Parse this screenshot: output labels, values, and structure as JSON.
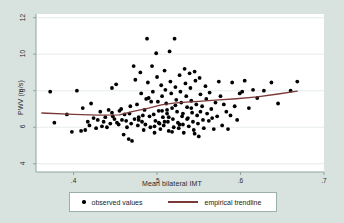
{
  "figure": {
    "background_color": "#d8e2de",
    "plot_background_color": "#ffffff"
  },
  "chart_data": {
    "type": "scatter",
    "title": "",
    "xlabel": "Mean bilateral IMT",
    "ylabel": "PWV (m/s)",
    "xlim": [
      0.355,
      0.7
    ],
    "ylim": [
      3.55,
      12.2
    ],
    "xticks": [
      ".4",
      ".5",
      ".6",
      ".7"
    ],
    "xtick_values": [
      0.4,
      0.5,
      0.6,
      0.7
    ],
    "yticks": [
      "4",
      "6",
      "8",
      "10",
      "12"
    ],
    "ytick_values": [
      4,
      6,
      8,
      10,
      12
    ],
    "grid": "horizontal",
    "legend_position": "bottom",
    "marker_color": "#000000",
    "trendline_color": "#7b3a3a",
    "series": [
      {
        "name": "observed values",
        "type": "scatter",
        "x": [
          0.372,
          0.377,
          0.392,
          0.398,
          0.404,
          0.409,
          0.411,
          0.414,
          0.417,
          0.419,
          0.421,
          0.424,
          0.427,
          0.429,
          0.432,
          0.434,
          0.436,
          0.438,
          0.44,
          0.442,
          0.444,
          0.446,
          0.447,
          0.449,
          0.451,
          0.452,
          0.454,
          0.455,
          0.457,
          0.458,
          0.46,
          0.461,
          0.463,
          0.464,
          0.466,
          0.467,
          0.469,
          0.47,
          0.472,
          0.473,
          0.474,
          0.476,
          0.477,
          0.478,
          0.48,
          0.481,
          0.482,
          0.484,
          0.485,
          0.486,
          0.488,
          0.489,
          0.49,
          0.491,
          0.492,
          0.494,
          0.495,
          0.496,
          0.497,
          0.498,
          0.499,
          0.5,
          0.501,
          0.502,
          0.503,
          0.504,
          0.505,
          0.506,
          0.507,
          0.508,
          0.509,
          0.51,
          0.511,
          0.512,
          0.513,
          0.514,
          0.515,
          0.516,
          0.517,
          0.518,
          0.519,
          0.52,
          0.521,
          0.522,
          0.523,
          0.524,
          0.525,
          0.526,
          0.527,
          0.528,
          0.529,
          0.53,
          0.531,
          0.532,
          0.533,
          0.534,
          0.535,
          0.536,
          0.537,
          0.538,
          0.539,
          0.54,
          0.541,
          0.542,
          0.543,
          0.544,
          0.545,
          0.546,
          0.547,
          0.548,
          0.549,
          0.55,
          0.551,
          0.552,
          0.554,
          0.555,
          0.556,
          0.558,
          0.559,
          0.56,
          0.562,
          0.563,
          0.565,
          0.566,
          0.568,
          0.57,
          0.572,
          0.574,
          0.576,
          0.578,
          0.58,
          0.583,
          0.585,
          0.588,
          0.59,
          0.593,
          0.596,
          0.599,
          0.602,
          0.605,
          0.61,
          0.615,
          0.62,
          0.628,
          0.637,
          0.645,
          0.66,
          0.668,
          0.446,
          0.468,
          0.483,
          0.493,
          0.506,
          0.514,
          0.522,
          0.531,
          0.541,
          0.552,
          0.478,
          0.497,
          0.509,
          0.518,
          0.527,
          0.536,
          0.545,
          0.487,
          0.502,
          0.512
        ],
        "y": [
          7.95,
          6.25,
          6.7,
          5.75,
          8.0,
          5.8,
          7.05,
          5.85,
          6.3,
          6.1,
          7.3,
          6.5,
          5.95,
          6.4,
          6.85,
          6.05,
          6.3,
          6.55,
          6.0,
          6.95,
          6.2,
          8.15,
          6.6,
          6.45,
          8.35,
          6.25,
          6.15,
          6.9,
          7.0,
          6.4,
          5.6,
          6.7,
          6.35,
          6.0,
          5.35,
          6.75,
          6.2,
          5.25,
          9.35,
          6.45,
          8.6,
          7.25,
          6.1,
          6.55,
          9.0,
          7.85,
          6.3,
          5.85,
          6.95,
          6.15,
          10.85,
          8.45,
          7.6,
          6.6,
          6.0,
          9.35,
          7.95,
          6.7,
          5.7,
          6.35,
          10.05,
          8.75,
          7.4,
          6.9,
          6.2,
          5.9,
          8.3,
          7.7,
          6.55,
          6.1,
          9.1,
          8.05,
          7.3,
          6.75,
          6.3,
          5.8,
          10.15,
          8.5,
          7.85,
          7.05,
          6.45,
          6.0,
          10.85,
          8.2,
          7.5,
          6.85,
          6.25,
          5.95,
          8.85,
          7.95,
          7.35,
          6.6,
          6.15,
          5.7,
          9.2,
          8.4,
          7.7,
          7.1,
          6.5,
          6.05,
          8.95,
          8.15,
          7.45,
          6.8,
          6.3,
          5.85,
          9.05,
          8.55,
          7.25,
          6.65,
          6.2,
          5.5,
          8.7,
          7.8,
          7.15,
          6.4,
          5.95,
          8.25,
          7.55,
          6.75,
          6.35,
          7.9,
          7.0,
          6.5,
          5.9,
          7.35,
          6.6,
          8.5,
          7.7,
          6.1,
          7.25,
          6.85,
          5.9,
          6.65,
          8.45,
          7.15,
          6.4,
          7.85,
          7.95,
          8.55,
          7.05,
          8.05,
          7.6,
          8.0,
          8.45,
          7.3,
          8.0,
          8.5,
          6.8,
          7.15,
          6.65,
          7.4,
          6.9,
          6.55,
          7.2,
          6.75,
          7.05,
          6.85,
          6.4,
          6.05,
          6.3,
          5.75,
          6.15,
          6.45,
          5.65,
          7.55,
          6.25,
          6.95
        ],
        "count": 168
      },
      {
        "name": "empirical trendline",
        "type": "line",
        "x": [
          0.362,
          0.4,
          0.43,
          0.455,
          0.47,
          0.49,
          0.505,
          0.52,
          0.535,
          0.55,
          0.57,
          0.595,
          0.62,
          0.645,
          0.668
        ],
        "y": [
          6.78,
          6.7,
          6.66,
          6.68,
          6.85,
          7.05,
          7.22,
          7.32,
          7.38,
          7.42,
          7.48,
          7.56,
          7.66,
          7.82,
          7.98
        ]
      }
    ]
  },
  "legend": {
    "observed_label": "observed values",
    "trendline_label": "empirical trendline"
  }
}
